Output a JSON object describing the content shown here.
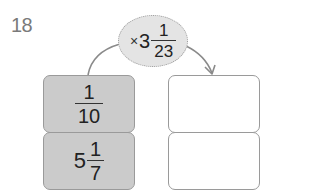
{
  "problem": {
    "number": "18"
  },
  "operator": {
    "symbol": "×",
    "whole": "3",
    "numerator": "1",
    "denominator": "23",
    "display": "× 3 1/23"
  },
  "given_values": [
    {
      "type": "fraction",
      "numerator": "1",
      "denominator": "10",
      "display": "1/10"
    },
    {
      "type": "mixed",
      "whole": "5",
      "numerator": "1",
      "denominator": "7",
      "display": "5 1/7"
    }
  ],
  "answer_boxes": [
    {
      "value": ""
    },
    {
      "value": ""
    }
  ],
  "colors": {
    "given_box_fill": "#cbcbcb",
    "answer_box_fill": "#ffffff",
    "bubble_fill": "#e4e4e4",
    "border": "#9a9a9a",
    "number_text": "#7a7a7a"
  }
}
